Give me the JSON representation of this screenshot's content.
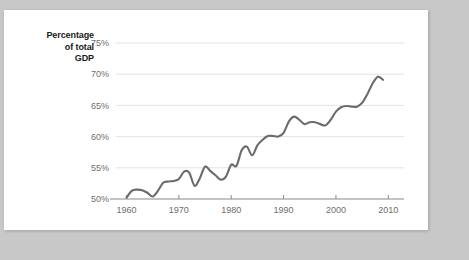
{
  "chart_data": {
    "type": "line",
    "title": "",
    "subtitle": "",
    "xlabel": "",
    "ylabel": "Percentage of total GDP",
    "ylabel_lines": [
      "Percentage",
      "of total",
      "GDP"
    ],
    "xlim": [
      1958,
      2013
    ],
    "ylim": [
      50,
      75
    ],
    "grid": true,
    "legend": "none",
    "line_color": "#6b6b6b",
    "gridline_color": "#e3e3e3",
    "axis_color": "#8a8a8a",
    "tick_label_color": "#6e6e6e",
    "ytick_labels": [
      "75%",
      "70%",
      "65%",
      "60%",
      "55%",
      "50%"
    ],
    "ytick_values": [
      75,
      70,
      65,
      60,
      55,
      50
    ],
    "xtick_labels": [
      "1960",
      "1970",
      "1980",
      "1990",
      "2000",
      "2010"
    ],
    "xtick_values": [
      1960,
      1970,
      1980,
      1990,
      2000,
      2010
    ],
    "series": [
      {
        "name": "Percentage of total GDP",
        "x": [
          1960,
          1961,
          1962,
          1963,
          1964,
          1965,
          1966,
          1967,
          1968,
          1969,
          1970,
          1971,
          1972,
          1973,
          1974,
          1975,
          1976,
          1977,
          1978,
          1979,
          1980,
          1981,
          1982,
          1983,
          1984,
          1985,
          1986,
          1987,
          1988,
          1989,
          1990,
          1991,
          1992,
          1993,
          1994,
          1995,
          1996,
          1997,
          1998,
          1999,
          2000,
          2001,
          2002,
          2003,
          2004,
          2005,
          2006,
          2007,
          2008,
          2009
        ],
        "values": [
          50.2,
          51.3,
          51.5,
          51.4,
          51.0,
          50.4,
          51.3,
          52.6,
          52.8,
          52.9,
          53.2,
          54.4,
          54.2,
          52.1,
          53.3,
          55.2,
          54.5,
          53.8,
          53.1,
          53.6,
          55.5,
          55.3,
          57.8,
          58.4,
          57.0,
          58.6,
          59.5,
          60.1,
          60.1,
          60.0,
          60.6,
          62.4,
          63.2,
          62.7,
          62.0,
          62.3,
          62.3,
          62.0,
          61.8,
          62.7,
          64.0,
          64.7,
          64.9,
          64.8,
          64.8,
          65.4,
          66.8,
          68.5,
          69.6,
          69.1
        ]
      }
    ]
  }
}
